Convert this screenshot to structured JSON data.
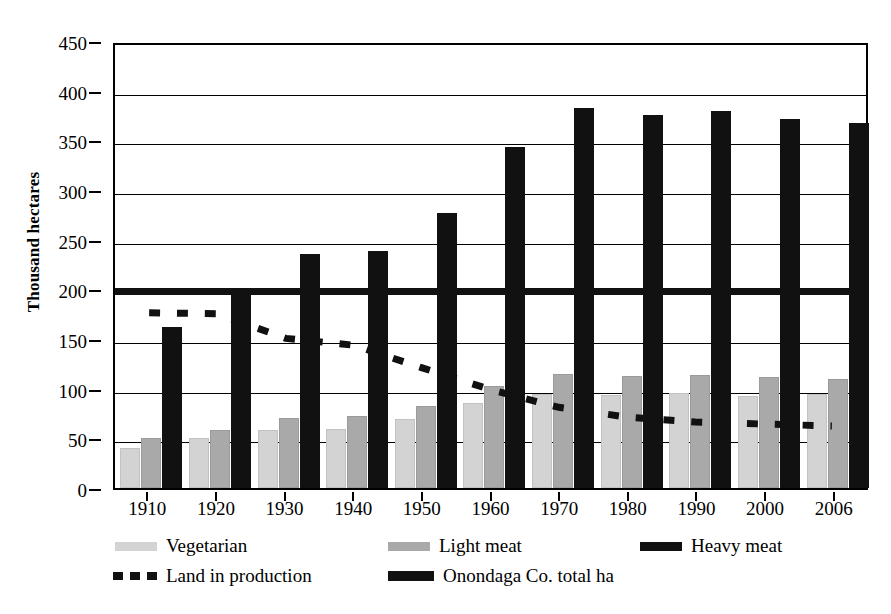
{
  "chart_data": {
    "type": "bar",
    "title": "",
    "subtitle": "",
    "xlabel": "",
    "ylabel": "Thousand hectares",
    "ylim": [
      0,
      450
    ],
    "ytick_step": 50,
    "yticks": [
      "0",
      "50",
      "100",
      "150",
      "200",
      "250",
      "300",
      "350",
      "400",
      "450"
    ],
    "grid": true,
    "legend_position": "below-axis",
    "categories": [
      "1910",
      "1920",
      "1930",
      "1940",
      "1950",
      "1960",
      "1970",
      "1980",
      "1990",
      "2000",
      "2006"
    ],
    "series": [
      {
        "name": "Vegetarian",
        "kind": "bar",
        "color": "#d3d3d3",
        "values": [
          40,
          50,
          58,
          59,
          69,
          86,
          95,
          94,
          96,
          93,
          95
        ]
      },
      {
        "name": "Light meat",
        "kind": "bar",
        "color": "#a9a9a9",
        "values": [
          50,
          58,
          70,
          72,
          83,
          103,
          115,
          113,
          114,
          112,
          110
        ]
      },
      {
        "name": "Heavy meat",
        "kind": "bar",
        "color": "#111111",
        "values": [
          162,
          195,
          236,
          239,
          277,
          343,
          383,
          376,
          380,
          371,
          367
        ]
      },
      {
        "name": "Land in production",
        "kind": "dashed-line",
        "color": "#111111",
        "values": [
          178,
          177,
          152,
          145,
          122,
          100,
          82,
          72,
          67,
          65,
          63
        ]
      },
      {
        "name": "Onondaga Co. total ha",
        "kind": "solid-line",
        "color": "#111111",
        "constant": 202,
        "values": [
          202,
          202,
          202,
          202,
          202,
          202,
          202,
          202,
          202,
          202,
          202
        ]
      }
    ]
  },
  "axes": {
    "y_title": "Thousand hectares"
  },
  "legend": {
    "row1": [
      {
        "label": "Vegetarian",
        "swatch": "veg-swatch"
      },
      {
        "label": "Light meat",
        "swatch": "light-meat-swatch"
      },
      {
        "label": "Heavy meat",
        "swatch": "heavy-meat-swatch"
      }
    ],
    "row2": [
      {
        "label": "Land in production",
        "swatch": "dashed-line-swatch"
      },
      {
        "label": "Onondaga Co. total ha",
        "swatch": "solid-line-swatch"
      }
    ]
  }
}
